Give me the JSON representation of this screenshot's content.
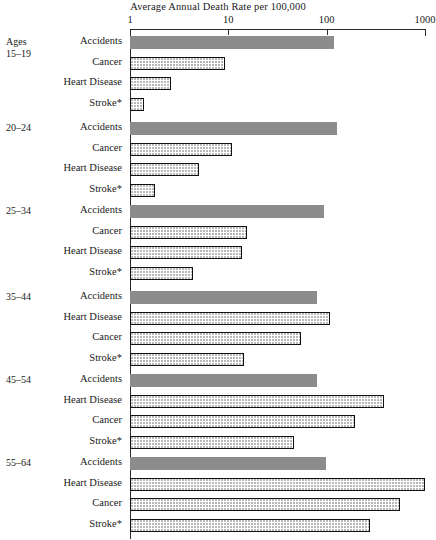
{
  "chart_data": {
    "type": "bar",
    "orientation": "horizontal",
    "title": "Average Annual Death Rate per 100,000",
    "xlabel": "",
    "ylabel": "",
    "xscale": "log",
    "xlim": [
      1,
      1000
    ],
    "xticks": [
      1,
      10,
      100,
      1000
    ],
    "xtick_labels": [
      "1",
      "10",
      "100",
      "1000"
    ],
    "grid": false,
    "legend": "none",
    "footnote": "* Stroke",
    "group_axis_title": "Ages",
    "groups": [
      {
        "label": "15–19",
        "label_prefix": "Ages",
        "bars": [
          {
            "category": "Accidents",
            "value": 118,
            "style": "solid"
          },
          {
            "category": "Cancer",
            "value": 9.2,
            "style": "dotted"
          },
          {
            "category": "Heart Disease",
            "value": 2.6,
            "style": "dotted"
          },
          {
            "category": "Stroke*",
            "value": 1.4,
            "style": "dotted"
          }
        ]
      },
      {
        "label": "20–24",
        "bars": [
          {
            "category": "Accidents",
            "value": 128,
            "style": "solid"
          },
          {
            "category": "Cancer",
            "value": 10.8,
            "style": "dotted"
          },
          {
            "category": "Heart Disease",
            "value": 5.0,
            "style": "dotted"
          },
          {
            "category": "Stroke*",
            "value": 1.8,
            "style": "dotted"
          }
        ]
      },
      {
        "label": "25–34",
        "bars": [
          {
            "category": "Accidents",
            "value": 94,
            "style": "solid"
          },
          {
            "category": "Cancer",
            "value": 15.4,
            "style": "dotted"
          },
          {
            "category": "Heart Disease",
            "value": 13.7,
            "style": "dotted"
          },
          {
            "category": "Stroke*",
            "value": 4.4,
            "style": "dotted"
          }
        ]
      },
      {
        "label": "35–44",
        "bars": [
          {
            "category": "Accidents",
            "value": 79,
            "style": "solid"
          },
          {
            "category": "Heart Disease",
            "value": 108,
            "style": "dotted"
          },
          {
            "category": "Cancer",
            "value": 55,
            "style": "dotted"
          },
          {
            "category": "Stroke*",
            "value": 14.4,
            "style": "dotted"
          }
        ]
      },
      {
        "label": "45–54",
        "bars": [
          {
            "category": "Accidents",
            "value": 80,
            "style": "solid"
          },
          {
            "category": "Heart Disease",
            "value": 385,
            "style": "dotted"
          },
          {
            "category": "Cancer",
            "value": 194,
            "style": "dotted"
          },
          {
            "category": "Stroke*",
            "value": 47,
            "style": "dotted"
          }
        ]
      },
      {
        "label": "55–64",
        "bars": [
          {
            "category": "Accidents",
            "value": 98,
            "style": "solid"
          },
          {
            "category": "Heart Disease",
            "value": 1000,
            "style": "dotted"
          },
          {
            "category": "Cancer",
            "value": 560,
            "style": "dotted"
          },
          {
            "category": "Stroke*",
            "value": 276,
            "style": "dotted"
          }
        ]
      }
    ],
    "colors": {
      "solid_bar": "#8c8c8c",
      "dotted_bar_fill": "#ffffff",
      "bar_border": "#111111",
      "axis": "#2a2a2a",
      "text": "#1a1a1a",
      "background": "#ffffff"
    }
  },
  "layout": {
    "axis_left_px": 130,
    "decade_px": 98.3,
    "group_tops": [
      36,
      122,
      205,
      291,
      374,
      457
    ],
    "row_pitch_px": 20.5,
    "bar_height_px": 13
  }
}
